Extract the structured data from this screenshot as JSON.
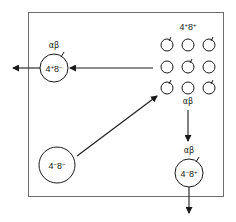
{
  "diagram": {
    "colors": {
      "stroke": "#1a1a1a",
      "box": "#6e6e6e",
      "background": "#ffffff"
    },
    "cells": {
      "double_negative": {
        "base1": "4",
        "sup1": "−",
        "base2": "8",
        "sup2": "−"
      },
      "double_positive_label": {
        "base1": "4",
        "sup1": "+",
        "base2": "8",
        "sup2": "+"
      },
      "cd4_single_positive": {
        "base1": "4",
        "sup1": "+",
        "base2": "8",
        "sup2": "−",
        "receptor": "αβ"
      },
      "cd8_single_positive": {
        "base1": "4",
        "sup1": "−",
        "base2": "8",
        "sup2": "+",
        "receptor": "αβ"
      }
    },
    "grid_receptor_label": "αβ",
    "grid": {
      "columns": [
        167,
        188,
        209
      ],
      "rows": [
        45,
        67,
        88
      ],
      "receptor_positions": [
        "0-0",
        "0-2",
        "1-1",
        "2-0",
        "2-2"
      ]
    },
    "arrows": [
      {
        "name": "dn-to-dp",
        "from": "4-8- cell",
        "to": "4+8+ cluster"
      },
      {
        "name": "dp-to-cd4",
        "from": "4+8+ cluster",
        "to": "4+8- cell"
      },
      {
        "name": "cd4-exit",
        "from": "4+8- cell",
        "to": "outside left"
      },
      {
        "name": "dp-to-cd8",
        "from": "4+8+ cluster",
        "to": "4-8+ cell"
      },
      {
        "name": "cd8-exit",
        "from": "4-8+ cell",
        "to": "outside bottom"
      }
    ]
  }
}
